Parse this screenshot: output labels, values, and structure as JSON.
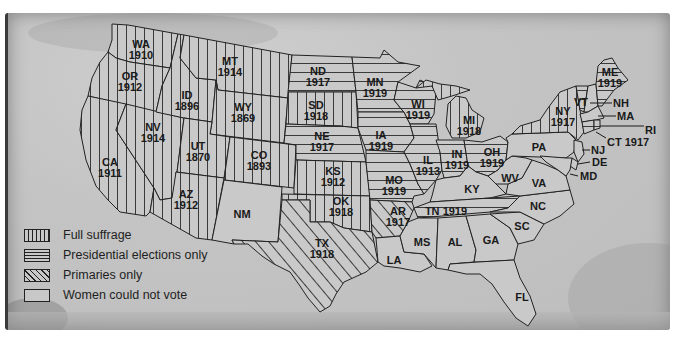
{
  "map": {
    "title": "Women's suffrage in the United States before the 19th Amendment",
    "colors": {
      "paper": "#c6c6c6",
      "ink": "#1a1a1a"
    },
    "legend": [
      {
        "key": "full",
        "label": "Full suffrage",
        "pattern": "vertical-lines"
      },
      {
        "key": "pres",
        "label": "Presidential elections only",
        "pattern": "horizontal-lines"
      },
      {
        "key": "prim",
        "label": "Primaries only",
        "pattern": "diagonal-lines"
      },
      {
        "key": "none",
        "label": "Women could not vote",
        "pattern": "blank"
      }
    ],
    "states": [
      {
        "abbr": "WA",
        "year": "1910",
        "status": "full"
      },
      {
        "abbr": "OR",
        "year": "1912",
        "status": "full"
      },
      {
        "abbr": "CA",
        "year": "1911",
        "status": "full"
      },
      {
        "abbr": "ID",
        "year": "1896",
        "status": "full"
      },
      {
        "abbr": "NV",
        "year": "1914",
        "status": "full"
      },
      {
        "abbr": "MT",
        "year": "1914",
        "status": "full"
      },
      {
        "abbr": "WY",
        "year": "1869",
        "status": "full"
      },
      {
        "abbr": "UT",
        "year": "1870",
        "status": "full"
      },
      {
        "abbr": "CO",
        "year": "1893",
        "status": "full"
      },
      {
        "abbr": "AZ",
        "year": "1912",
        "status": "full"
      },
      {
        "abbr": "NM",
        "year": "",
        "status": "none"
      },
      {
        "abbr": "ND",
        "year": "1917",
        "status": "pres"
      },
      {
        "abbr": "SD",
        "year": "1918",
        "status": "full"
      },
      {
        "abbr": "NE",
        "year": "1917",
        "status": "pres"
      },
      {
        "abbr": "KS",
        "year": "1912",
        "status": "full"
      },
      {
        "abbr": "OK",
        "year": "1918",
        "status": "full"
      },
      {
        "abbr": "TX",
        "year": "1918",
        "status": "prim"
      },
      {
        "abbr": "MN",
        "year": "1919",
        "status": "pres"
      },
      {
        "abbr": "IA",
        "year": "1919",
        "status": "pres"
      },
      {
        "abbr": "MO",
        "year": "1919",
        "status": "pres"
      },
      {
        "abbr": "AR",
        "year": "1917",
        "status": "prim"
      },
      {
        "abbr": "LA",
        "year": "",
        "status": "none"
      },
      {
        "abbr": "WI",
        "year": "1919",
        "status": "pres"
      },
      {
        "abbr": "IL",
        "year": "1913",
        "status": "pres"
      },
      {
        "abbr": "MI",
        "year": "1918",
        "status": "full"
      },
      {
        "abbr": "IN",
        "year": "1919",
        "status": "pres"
      },
      {
        "abbr": "OH",
        "year": "1919",
        "status": "pres"
      },
      {
        "abbr": "KY",
        "year": "",
        "status": "none"
      },
      {
        "abbr": "TN",
        "year": "1919",
        "status": "pres"
      },
      {
        "abbr": "MS",
        "year": "",
        "status": "none"
      },
      {
        "abbr": "AL",
        "year": "",
        "status": "none"
      },
      {
        "abbr": "GA",
        "year": "",
        "status": "none"
      },
      {
        "abbr": "FL",
        "year": "",
        "status": "none"
      },
      {
        "abbr": "SC",
        "year": "",
        "status": "none"
      },
      {
        "abbr": "NC",
        "year": "",
        "status": "none"
      },
      {
        "abbr": "VA",
        "year": "",
        "status": "none"
      },
      {
        "abbr": "WV",
        "year": "",
        "status": "none"
      },
      {
        "abbr": "PA",
        "year": "",
        "status": "none"
      },
      {
        "abbr": "NY",
        "year": "1917",
        "status": "full"
      },
      {
        "abbr": "VT",
        "year": "",
        "status": "pres"
      },
      {
        "abbr": "ME",
        "year": "1919",
        "status": "pres"
      },
      {
        "abbr": "NH",
        "year": "",
        "status": "none"
      },
      {
        "abbr": "MA",
        "year": "",
        "status": "none"
      },
      {
        "abbr": "RI",
        "year": "",
        "status": "pres"
      },
      {
        "abbr": "CT",
        "year": "1917",
        "status": "pres"
      },
      {
        "abbr": "NJ",
        "year": "",
        "status": "none"
      },
      {
        "abbr": "DE",
        "year": "",
        "status": "none"
      },
      {
        "abbr": "MD",
        "year": "",
        "status": "none"
      }
    ]
  }
}
